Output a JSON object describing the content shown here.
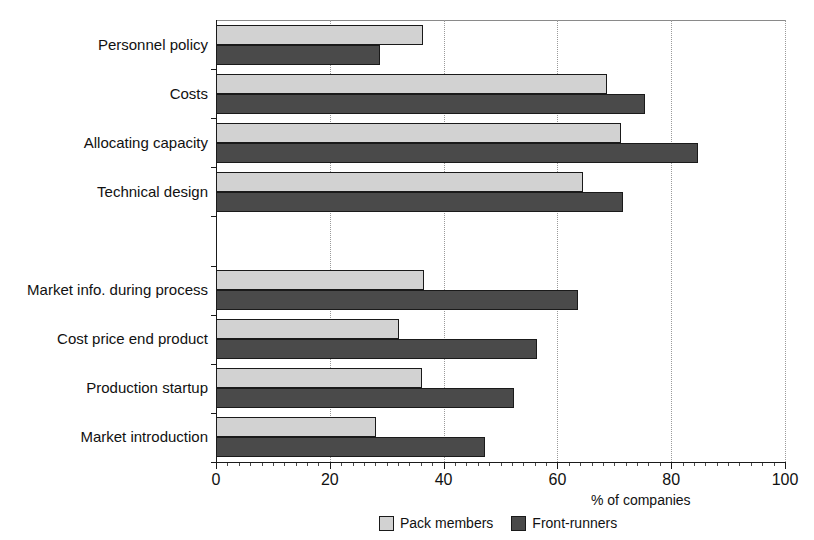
{
  "chart_data": {
    "type": "bar",
    "orientation": "horizontal",
    "title": "",
    "xlabel": "% of companies",
    "ylabel": "",
    "xlim": [
      0,
      100
    ],
    "xticks": [
      0,
      20,
      40,
      60,
      80,
      100
    ],
    "xtick_labels": [
      "0",
      "20",
      "40",
      "60",
      "80",
      "100"
    ],
    "minor_tick_step": 2,
    "grid": "vertical dotted gridlines at major x ticks",
    "legend_position": "bottom center",
    "categories": [
      "Personnel policy",
      "Costs",
      "Allocating capacity",
      "Technical design",
      "",
      "Market info. during process",
      "Cost price end product",
      "Production startup",
      "Market introduction"
    ],
    "series": [
      {
        "name": "Pack members",
        "color": "#d2d2d2",
        "values": [
          36.4,
          68.7,
          71.2,
          64.5,
          null,
          36.5,
          32.2,
          36.2,
          28.1
        ]
      },
      {
        "name": "Front-runners",
        "color": "#4a4a4a",
        "values": [
          28.8,
          75.4,
          84.7,
          71.5,
          null,
          63.6,
          56.4,
          52.4,
          47.3
        ]
      }
    ]
  },
  "axis": {
    "x_title": "% of companies",
    "tick_labels": [
      "0",
      "20",
      "40",
      "60",
      "80",
      "100"
    ]
  },
  "legend": {
    "items": [
      {
        "label": "Pack members",
        "color": "#d2d2d2"
      },
      {
        "label": "Front-runners",
        "color": "#4a4a4a"
      }
    ]
  },
  "caption": {
    "remnant": ""
  },
  "colors": {
    "pack_members": "#d2d2d2",
    "front_runners": "#4a4a4a",
    "axis": "#1a1a1a",
    "grid": "#9a9a9a",
    "background": "#ffffff"
  }
}
